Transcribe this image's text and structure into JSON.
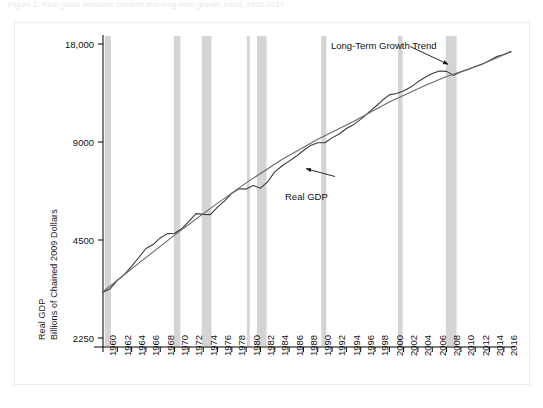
{
  "caption": "Figure 1. Real gross domestic product and long-term growth trend, 1960-2017",
  "chart_data": {
    "type": "line",
    "title": "",
    "xlabel": "",
    "ylabel": "Real GDP Billions of Chained 2009 Dollars",
    "ylabel_lines": [
      "Real GDP",
      "Billions of Chained 2009 Dollars"
    ],
    "yscale": "log",
    "ylim": [
      2250,
      18000
    ],
    "yticks": [
      2250,
      4500,
      9000,
      18000
    ],
    "ytick_labels": [
      "2250",
      "4500",
      "9000",
      "18,000"
    ],
    "xlim": [
      1960,
      2017
    ],
    "xticks": [
      1960,
      1962,
      1964,
      1966,
      1968,
      1970,
      1972,
      1974,
      1976,
      1978,
      1980,
      1982,
      1984,
      1986,
      1988,
      1990,
      1992,
      1994,
      1996,
      1998,
      2000,
      2002,
      2004,
      2006,
      2008,
      2010,
      2012,
      2014,
      2016
    ],
    "xtick_labels": [
      "1960",
      "1962",
      "1964",
      "1966",
      "1968",
      "1970",
      "1972",
      "1974",
      "1976",
      "1978",
      "1980",
      "1982",
      "1984",
      "1986",
      "1988",
      "1990",
      "1992",
      "1994",
      "1996",
      "1998",
      "2000",
      "2002",
      "2004",
      "2006",
      "2008",
      "2010",
      "2012",
      "2014",
      "2016"
    ],
    "grid": false,
    "legend_position": "none",
    "annotations": [
      {
        "name": "long-term-growth-trend",
        "text": "Long-Term Growth Trend",
        "x": 1999.5,
        "y": 16400,
        "arrow_to_x": 2008.2,
        "arrow_to_y": 15600
      },
      {
        "name": "real-gdp",
        "text": "Real GDP",
        "x": 1993.0,
        "y": 6750,
        "arrow_to_x": 1988.4,
        "arrow_to_y": 7450
      }
    ],
    "colors": {
      "real_gdp_line": "#3a3a3a",
      "trend_line": "#6a6a6a",
      "recession_band": "#d4d4d4",
      "axis": "#000000",
      "background": "#ffffff",
      "frame_border": "#ececec"
    },
    "recession_bands": [
      {
        "name": "recession-1960-1961",
        "start": 1960.25,
        "end": 1961.1
      },
      {
        "name": "recession-1969-1970",
        "start": 1969.9,
        "end": 1970.8
      },
      {
        "name": "recession-1973-1975",
        "start": 1973.8,
        "end": 1975.15
      },
      {
        "name": "recession-1980",
        "start": 1980.1,
        "end": 1980.5
      },
      {
        "name": "recession-1981-1982",
        "start": 1981.5,
        "end": 1982.85
      },
      {
        "name": "recession-1990-1991",
        "start": 1990.5,
        "end": 1991.2
      },
      {
        "name": "recession-2001",
        "start": 2001.2,
        "end": 2001.85
      },
      {
        "name": "recession-2007-2009",
        "start": 2007.9,
        "end": 2009.4
      }
    ],
    "series": [
      {
        "name": "Real GDP",
        "x": [
          1960,
          1961,
          1962,
          1963,
          1964,
          1965,
          1966,
          1967,
          1968,
          1969,
          1970,
          1971,
          1972,
          1973,
          1974,
          1975,
          1976,
          1977,
          1978,
          1979,
          1980,
          1981,
          1982,
          1983,
          1984,
          1985,
          1986,
          1987,
          1988,
          1989,
          1990,
          1991,
          1992,
          1993,
          1994,
          1995,
          1996,
          1997,
          1998,
          1999,
          2000,
          2001,
          2002,
          2003,
          2004,
          2005,
          2006,
          2007,
          2008,
          2009,
          2010,
          2011,
          2012,
          2013,
          2014,
          2015,
          2016,
          2017
        ],
        "values": [
          3108,
          3188,
          3383,
          3530,
          3734,
          3977,
          4238,
          4356,
          4565,
          4708,
          4718,
          4877,
          5134,
          5424,
          5396,
          5385,
          5675,
          5937,
          6267,
          6466,
          6450,
          6618,
          6491,
          6792,
          7285,
          7594,
          7861,
          8133,
          8475,
          8786,
          8955,
          8948,
          9267,
          9521,
          9905,
          10175,
          10561,
          11035,
          11526,
          12066,
          12560,
          12682,
          12909,
          13271,
          13774,
          14234,
          14614,
          14874,
          14830,
          14419,
          14784,
          15021,
          15355,
          15612,
          16013,
          16472,
          16716,
          17096
        ],
        "units": "Billions of Chained 2009 Dollars",
        "style": "solid",
        "color": "#3a3a3a"
      },
      {
        "name": "Long-Term Growth Trend",
        "x": [
          1960,
          1965,
          1970,
          1975,
          1980,
          1985,
          1990,
          1995,
          2000,
          2005,
          2008,
          2010,
          2012,
          2014,
          2016,
          2017
        ],
        "values": [
          3120,
          3820,
          4660,
          5630,
          6740,
          7950,
          9180,
          10410,
          11940,
          13420,
          14300,
          14780,
          15320,
          15960,
          16680,
          17000
        ],
        "units": "Billions of Chained 2009 Dollars",
        "style": "solid",
        "color": "#6a6a6a"
      }
    ]
  }
}
